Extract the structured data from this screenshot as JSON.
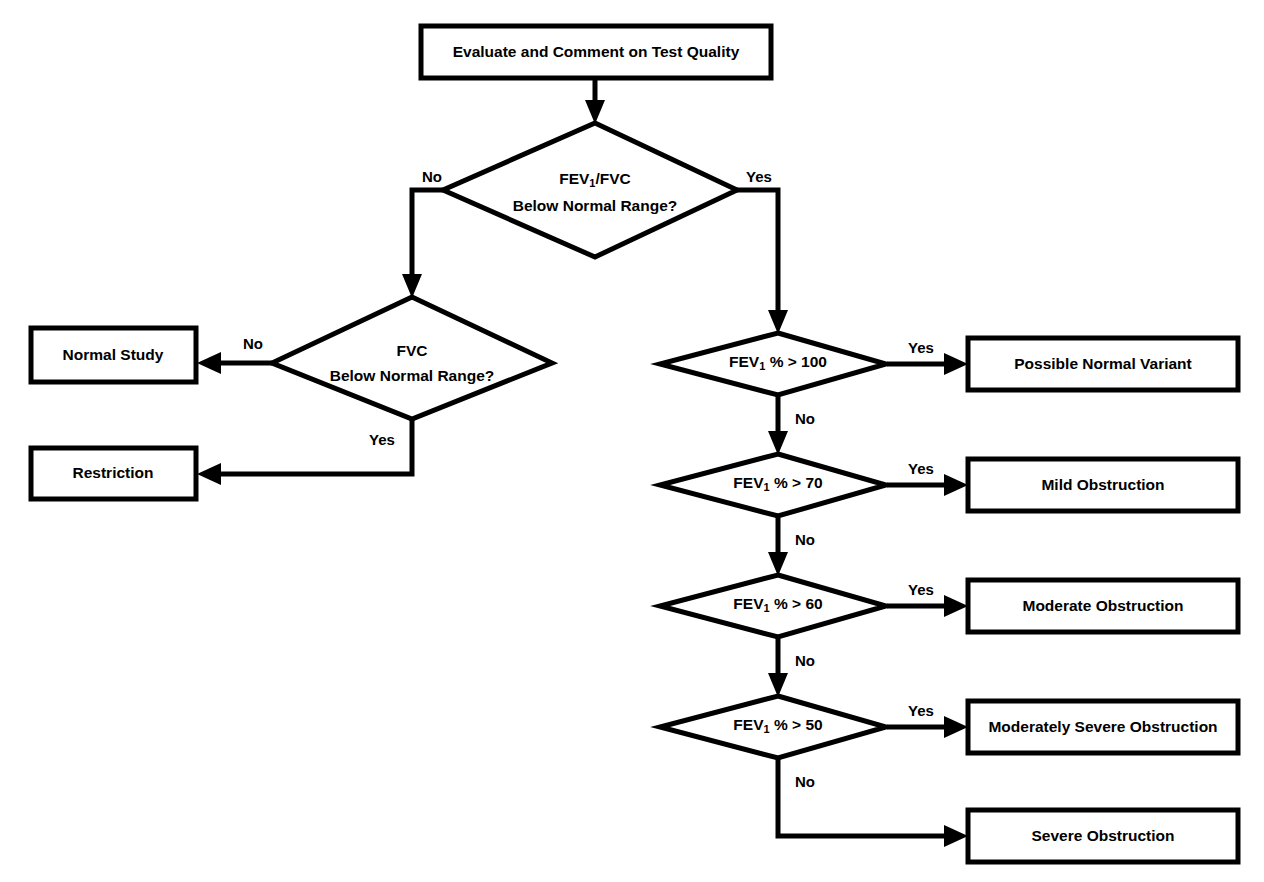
{
  "diagram": {
    "type": "flowchart",
    "title_text": "Spirometry interpretation flowchart",
    "colors": {
      "stroke": "#000000",
      "fill": "#ffffff",
      "text": "#000000"
    },
    "nodes": {
      "start": {
        "shape": "process-box",
        "label": "Evaluate and Comment on Test Quality"
      },
      "d_fev1_fvc": {
        "shape": "decision-diamond",
        "line1_pre": "FEV",
        "line1_sub": "1",
        "line1_post": "/FVC",
        "line2": "Below Normal Range?"
      },
      "d_fvc": {
        "shape": "decision-diamond",
        "line1": "FVC",
        "line2": "Below Normal Range?"
      },
      "t_normal_study": {
        "shape": "terminal-box",
        "label": "Normal Study"
      },
      "t_restriction": {
        "shape": "terminal-box",
        "label": "Restriction"
      },
      "d_fev1_100": {
        "shape": "decision-diamond",
        "pre": "FEV",
        "sub": "1",
        "post": " % > 100"
      },
      "d_fev1_70": {
        "shape": "decision-diamond",
        "pre": "FEV",
        "sub": "1",
        "post": " % > 70"
      },
      "d_fev1_60": {
        "shape": "decision-diamond",
        "pre": "FEV",
        "sub": "1",
        "post": " % > 60"
      },
      "d_fev1_50": {
        "shape": "decision-diamond",
        "pre": "FEV",
        "sub": "1",
        "post": " % > 50"
      },
      "t_possible_normal_variant": {
        "shape": "terminal-box",
        "label": "Possible Normal Variant"
      },
      "t_mild": {
        "shape": "terminal-box",
        "label": "Mild Obstruction"
      },
      "t_moderate": {
        "shape": "terminal-box",
        "label": "Moderate Obstruction"
      },
      "t_moderately_severe": {
        "shape": "terminal-box",
        "label": "Moderately Severe Obstruction"
      },
      "t_severe": {
        "shape": "terminal-box",
        "label": "Severe Obstruction"
      }
    },
    "edge_labels": {
      "fev1fvc_no": "No",
      "fev1fvc_yes": "Yes",
      "fvc_no": "No",
      "fvc_yes": "Yes",
      "d100_yes": "Yes",
      "d100_no": "No",
      "d70_yes": "Yes",
      "d70_no": "No",
      "d60_yes": "Yes",
      "d60_no": "No",
      "d50_yes": "Yes",
      "d50_no": "No"
    }
  }
}
